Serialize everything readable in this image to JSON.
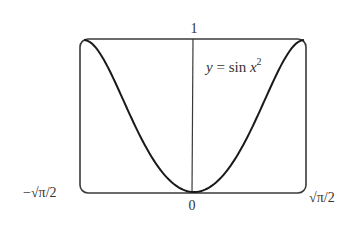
{
  "figure": {
    "type": "function-graph",
    "equation_label": {
      "y": "y",
      "eq": " = sin ",
      "x": "x",
      "exp": "2"
    },
    "axis_labels": {
      "y_top": "1",
      "x_origin": "0",
      "x_left": "−√π/2",
      "x_right": "√π/2"
    },
    "colors": {
      "curve": "#1a1a1a",
      "frame": "#333333",
      "text": "#333333"
    }
  },
  "chart_data": {
    "type": "line",
    "xlabel": "",
    "ylabel": "",
    "x_range": [
      "−√π/2",
      "√π/2"
    ],
    "xlim": [
      -1.2533,
      1.2533
    ],
    "ylim": [
      0,
      1
    ],
    "tick_labels": {
      "x": [
        "−√π/2",
        "0",
        "√π/2"
      ],
      "y": [
        "1"
      ]
    },
    "grid": false,
    "legend": null,
    "series": [
      {
        "name": "y = sin x²",
        "x": [
          -1.2533,
          -1.1,
          -0.9,
          -0.7,
          -0.5,
          -0.3,
          0,
          0.3,
          0.5,
          0.7,
          0.9,
          1.1,
          1.2533
        ],
        "y": [
          1.0,
          0.936,
          0.717,
          0.468,
          0.247,
          0.09,
          0.0,
          0.09,
          0.247,
          0.468,
          0.717,
          0.936,
          1.0
        ]
      }
    ]
  }
}
